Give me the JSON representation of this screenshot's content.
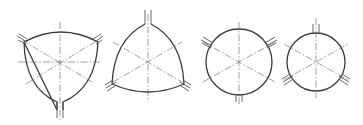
{
  "figure": {
    "stroke_color": "#3a3a3a",
    "axis_color": "#777777",
    "background": "#ffffff",
    "shapes": [
      {
        "id": "profile-1",
        "kind": "reuleaux-down",
        "center": [
          60,
          62
        ],
        "stubs": [
          "top-left",
          "top-right",
          "bottom"
        ]
      },
      {
        "id": "profile-2",
        "kind": "reuleaux-up",
        "center": [
          148,
          62
        ],
        "stubs": [
          "top",
          "bottom-left",
          "bottom-right"
        ]
      },
      {
        "id": "profile-3",
        "kind": "circle",
        "center": [
          239,
          62
        ],
        "radius": 33,
        "stubs": [
          "upper-left",
          "upper-right",
          "bottom"
        ]
      },
      {
        "id": "profile-4",
        "kind": "circle",
        "center": [
          316,
          62
        ],
        "radius": 29,
        "stubs": [
          "top",
          "lower-left",
          "lower-right"
        ]
      }
    ]
  }
}
